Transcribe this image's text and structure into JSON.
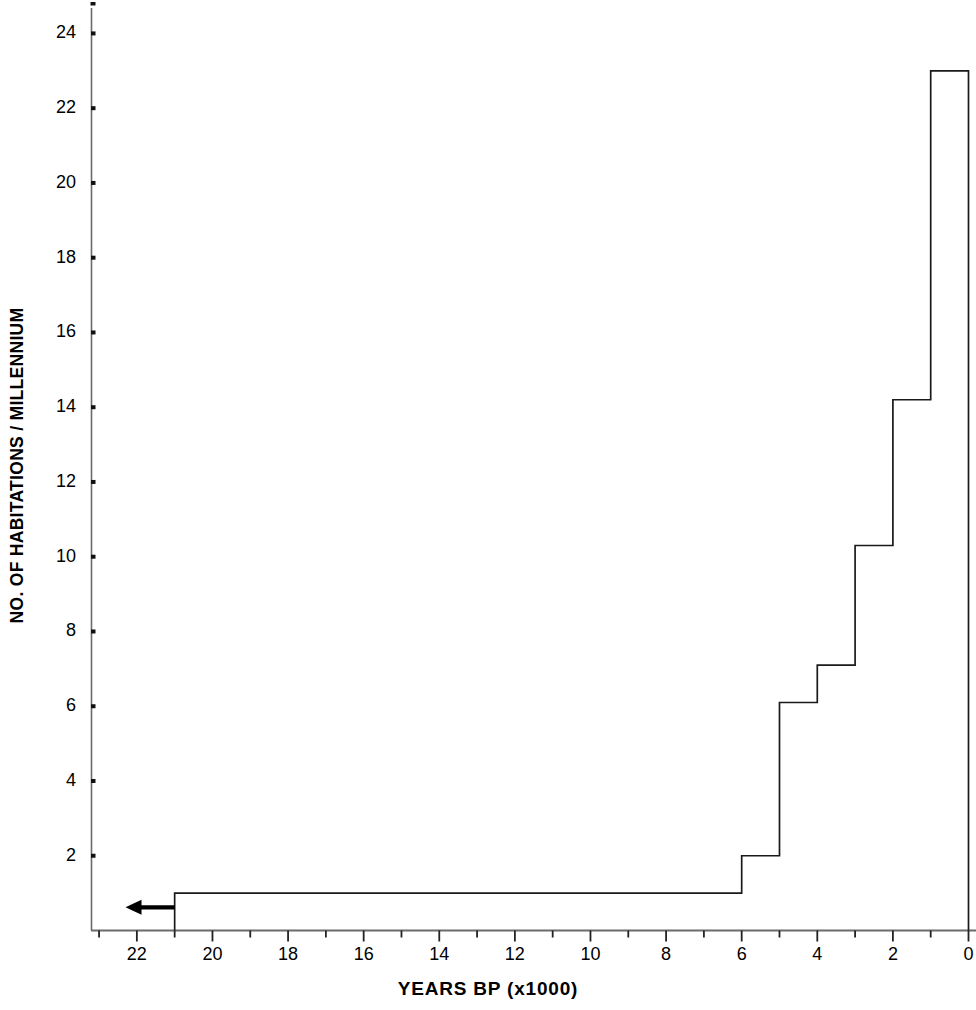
{
  "chart_data": {
    "type": "line",
    "subtype": "step-post",
    "title": "",
    "xlabel": "YEARS BP (x1000)",
    "ylabel": "NO. OF HABITATIONS / MILLENNIUM",
    "xlim": [
      23.2,
      0
    ],
    "ylim": [
      0,
      24.6
    ],
    "x_axis_reversed": true,
    "grid": false,
    "legend": false,
    "xticks": [
      22,
      20,
      18,
      16,
      14,
      12,
      10,
      8,
      6,
      4,
      2,
      0
    ],
    "xtick_labels": [
      "22",
      "20",
      "18",
      "16",
      "14",
      "12",
      "10",
      "8",
      "6",
      "4",
      "2",
      "0"
    ],
    "x_minor_ticks": [
      23,
      21,
      19,
      17,
      15,
      13,
      11,
      9,
      7,
      5,
      3,
      1
    ],
    "yticks": [
      2,
      4,
      6,
      8,
      10,
      12,
      14,
      16,
      18,
      20,
      22,
      24
    ],
    "ytick_labels": [
      "2",
      "4",
      "6",
      "8",
      "10",
      "12",
      "14",
      "16",
      "18",
      "20",
      "22",
      "24"
    ],
    "y_minor_ticks": [
      1,
      3,
      5,
      7,
      9,
      11,
      13,
      15,
      17,
      19,
      21,
      23,
      25
    ],
    "series": [
      {
        "name": "habitations per millennium",
        "bins": [
          {
            "x_start": 21,
            "x_end": 6,
            "value": 1.0
          },
          {
            "x_start": 6,
            "x_end": 5,
            "value": 2.0
          },
          {
            "x_start": 5,
            "x_end": 4,
            "value": 6.1
          },
          {
            "x_start": 4,
            "x_end": 3,
            "value": 7.1
          },
          {
            "x_start": 3,
            "x_end": 2,
            "value": 10.3
          },
          {
            "x_start": 2,
            "x_end": 1,
            "value": 14.2
          },
          {
            "x_start": 1,
            "x_end": 0,
            "value": 23.0
          }
        ]
      }
    ],
    "annotations": [
      {
        "type": "arrow",
        "direction": "left",
        "label": "",
        "x_tail": 21.0,
        "x_head": 22.3,
        "y": 0.62
      }
    ],
    "colors": {
      "line": "#1a1a1a",
      "axis": "#555555",
      "background": "#ffffff",
      "text": "#000000"
    }
  }
}
